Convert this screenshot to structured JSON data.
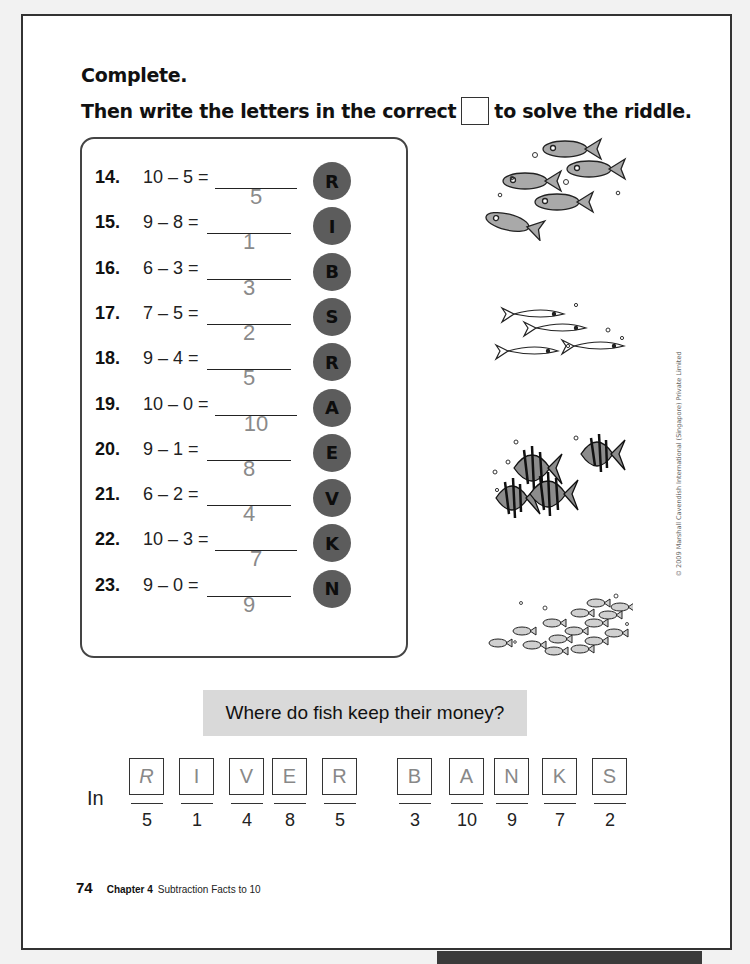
{
  "instructions": {
    "line1": "Complete.",
    "line2_before": "Then write the letters in the correct",
    "line2_after": "to solve the riddle."
  },
  "problems": [
    {
      "number": "14.",
      "expression": "10 – 5 =",
      "answer": "5",
      "letter": "R",
      "blank_width": 82
    },
    {
      "number": "15.",
      "expression": "9 – 8 =",
      "answer": "1",
      "letter": "I",
      "blank_width": 82
    },
    {
      "number": "16.",
      "expression": "6 – 3 =",
      "answer": "3",
      "letter": "B",
      "blank_width": 82
    },
    {
      "number": "17.",
      "expression": "7 – 5 =",
      "answer": "2",
      "letter": "S",
      "blank_width": 82
    },
    {
      "number": "18.",
      "expression": "9 – 4 =",
      "answer": "5",
      "letter": "R",
      "blank_width": 82
    },
    {
      "number": "19.",
      "expression": "10 – 0 =",
      "answer": "10",
      "letter": "A",
      "blank_width": 82
    },
    {
      "number": "20.",
      "expression": "9 – 1 =",
      "answer": "8",
      "letter": "E",
      "blank_width": 82
    },
    {
      "number": "21.",
      "expression": "6 – 2 =",
      "answer": "4",
      "letter": "V",
      "blank_width": 82
    },
    {
      "number": "22.",
      "expression": "10 – 3 =",
      "answer": "7",
      "letter": "K",
      "blank_width": 82
    },
    {
      "number": "23.",
      "expression": "9 – 0 =",
      "answer": "9",
      "letter": "N",
      "blank_width": 82
    }
  ],
  "riddle": {
    "question": "Where do fish keep their money?",
    "prefix": "In",
    "slots": [
      {
        "letter": "R",
        "number": "5"
      },
      {
        "letter": "I",
        "number": "1"
      },
      {
        "letter": "V",
        "number": "4"
      },
      {
        "letter": "E",
        "number": "8"
      },
      {
        "letter": "R",
        "number": "5"
      },
      {
        "letter": "B",
        "number": "3"
      },
      {
        "letter": "A",
        "number": "10"
      },
      {
        "letter": "N",
        "number": "9"
      },
      {
        "letter": "K",
        "number": "7"
      },
      {
        "letter": "S",
        "number": "2"
      }
    ]
  },
  "illustrations": [
    "fish-school-1-icon",
    "fish-school-2-icon",
    "angelfish-group-icon",
    "small-fish-school-icon"
  ],
  "copyright": "© 2009 Marshall Cavendish International (Singapore) Private Limited",
  "footer": {
    "page_number": "74",
    "chapter": "Chapter 4",
    "chapter_title": "Subtraction Facts to 10"
  },
  "colors": {
    "circle_fill": "#5c5c5c",
    "banner_fill": "#d9d9d9",
    "answer_text": "#8a8a8a"
  }
}
